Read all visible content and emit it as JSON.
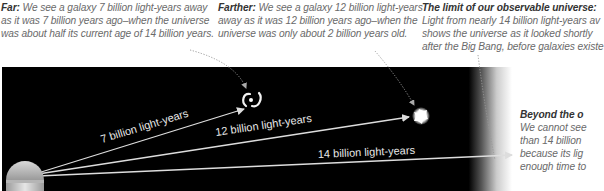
{
  "captions": {
    "far": {
      "heading": "Far:",
      "lines": [
        "We see a galaxy 7 billion light-years away",
        "as it was 7 billion years ago–when the universe",
        "was about half its current age of 14 billion years."
      ]
    },
    "farther": {
      "heading": "Farther:",
      "lines": [
        "We see a galaxy 12 billion light-years",
        "away as it was 12 billion years ago–when the",
        "universe was only about 2 billion years old."
      ]
    },
    "limit": {
      "heading": "The limit of our observable universe:",
      "lines": [
        "Light from nearly 14 billion light-years av",
        "shows the universe as it looked shortly",
        "after the Big Bang, before galaxies existe"
      ]
    },
    "beyond": {
      "heading": "Beyond the o",
      "lines": [
        "We cannot see",
        "than 14 billion",
        "because its lig",
        "enough time to"
      ]
    }
  },
  "distances": {
    "d7": "7 billion light-years",
    "d12": "12 billion light-years",
    "d14": "14 billion light-years"
  },
  "icons": {
    "observer": "telescope-dome-icon",
    "galaxy7": "spiral-galaxy-icon",
    "galaxy12": "young-galaxy-icon"
  },
  "colors": {
    "space": "#000000",
    "arrow": "#dddddd",
    "caption_text": "#6a6a6a",
    "caption_heading": "#333333"
  }
}
